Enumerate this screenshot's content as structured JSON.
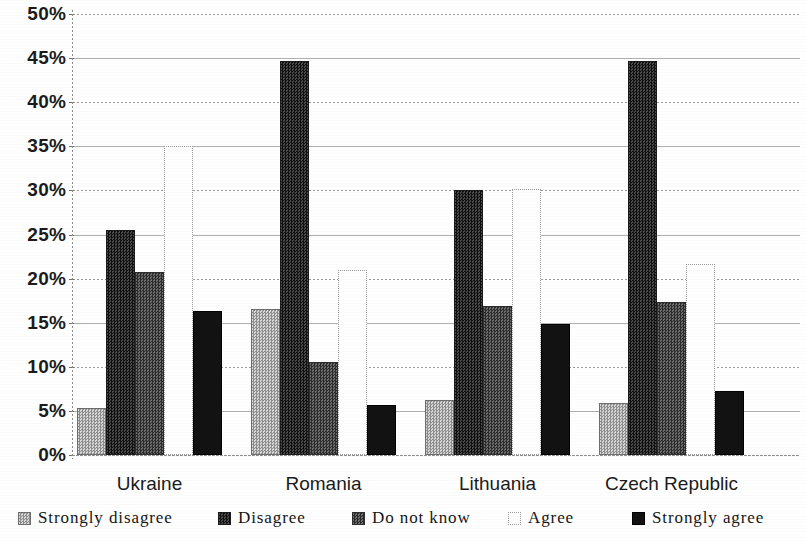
{
  "chart_data": {
    "type": "bar",
    "title": "",
    "subtitle": "",
    "xlabel": "",
    "ylabel": "",
    "grid": true,
    "legend_position": "bottom",
    "ylim": [
      0,
      50
    ],
    "ytick_labels": [
      "0%",
      "5%",
      "10%",
      "15%",
      "20%",
      "25%",
      "30%",
      "35%",
      "40%",
      "45%",
      "50%"
    ],
    "ytick_values": [
      0,
      5,
      10,
      15,
      20,
      25,
      30,
      35,
      40,
      45,
      50
    ],
    "categories": [
      "Ukraine",
      "Romania",
      "Lithuania",
      "Czech Republic"
    ],
    "series": [
      {
        "name": "Strongly disagree",
        "color": "#a0a0a0",
        "values": [
          5.3,
          16.6,
          6.2,
          5.9
        ]
      },
      {
        "name": "Disagree",
        "color": "#303030",
        "values": [
          25.5,
          44.7,
          30.0,
          44.7
        ]
      },
      {
        "name": "Do not know",
        "color": "#555555",
        "values": [
          20.8,
          10.5,
          16.9,
          17.4
        ]
      },
      {
        "name": "Agree",
        "color": "#ffffff",
        "values": [
          35.0,
          21.0,
          30.2,
          21.7
        ]
      },
      {
        "name": "Strongly agree",
        "color": "#121212",
        "values": [
          16.3,
          5.7,
          14.8,
          7.3
        ]
      }
    ]
  },
  "legend": {
    "items": [
      {
        "label": "Strongly disagree",
        "swatch": "swatch-strongly-disagree"
      },
      {
        "label": "Disagree",
        "swatch": "swatch-disagree"
      },
      {
        "label": "Do not know",
        "swatch": "swatch-do-not-know"
      },
      {
        "label": "Agree",
        "swatch": "swatch-agree"
      },
      {
        "label": "Strongly agree",
        "swatch": "swatch-strongly-agree"
      }
    ]
  }
}
